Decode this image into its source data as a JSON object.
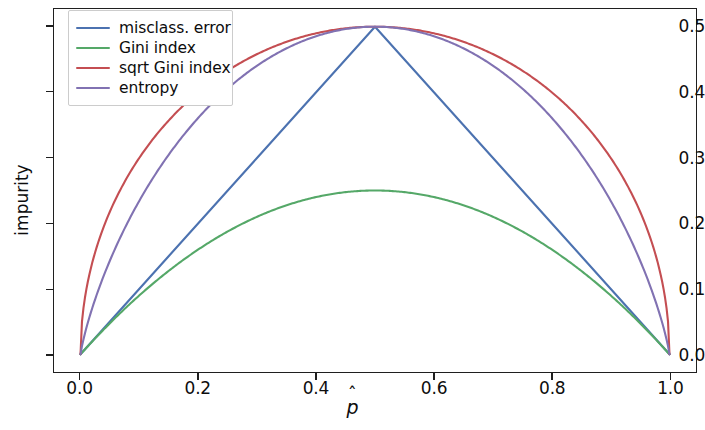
{
  "chart_data": {
    "type": "line",
    "title": "",
    "xlabel": "p̂",
    "xlabel_base": "p",
    "xlabel_accent": "ˆ",
    "ylabel": "impurity",
    "xlim": [
      -0.045,
      1.045
    ],
    "ylim": [
      -0.027,
      0.527
    ],
    "xticks": [
      0.0,
      0.2,
      0.4,
      0.6,
      0.8,
      1.0
    ],
    "xticklabels": [
      "0.0",
      "0.2",
      "0.4",
      "0.6",
      "0.8",
      "1.0"
    ],
    "yticks": [
      0.0,
      0.1,
      0.2,
      0.3,
      0.4,
      0.5
    ],
    "yticklabels": [
      "0.0",
      "0.1",
      "0.2",
      "0.3",
      "0.4",
      "0.5"
    ],
    "grid": false,
    "legend_position": "upper left",
    "background": "#ffffff",
    "axes_color": "#1f1f1f",
    "series": [
      {
        "name": "misclass. error",
        "color": "#4c72b0",
        "formula": "min(p, 1-p)",
        "x": [
          0.0,
          0.05,
          0.1,
          0.15,
          0.2,
          0.25,
          0.3,
          0.35,
          0.4,
          0.45,
          0.5,
          0.55,
          0.6,
          0.65,
          0.7,
          0.75,
          0.8,
          0.85,
          0.9,
          0.95,
          1.0
        ],
        "values": [
          0.0,
          0.05,
          0.1,
          0.15,
          0.2,
          0.25,
          0.3,
          0.35,
          0.4,
          0.45,
          0.5,
          0.45,
          0.4,
          0.35,
          0.3,
          0.25,
          0.2,
          0.15,
          0.1,
          0.05,
          0.0
        ]
      },
      {
        "name": "Gini index",
        "color": "#55a868",
        "formula": "p*(1-p)",
        "x": [
          0.0,
          0.05,
          0.1,
          0.15,
          0.2,
          0.25,
          0.3,
          0.35,
          0.4,
          0.45,
          0.5,
          0.55,
          0.6,
          0.65,
          0.7,
          0.75,
          0.8,
          0.85,
          0.9,
          0.95,
          1.0
        ],
        "values": [
          0.0,
          0.0475,
          0.09,
          0.1275,
          0.16,
          0.1875,
          0.21,
          0.2275,
          0.24,
          0.2475,
          0.25,
          0.2475,
          0.24,
          0.2275,
          0.21,
          0.1875,
          0.16,
          0.1275,
          0.09,
          0.0475,
          0.0
        ]
      },
      {
        "name": "sqrt Gini index",
        "color": "#c44e52",
        "formula": "sqrt(p*(1-p))",
        "x": [
          0.0,
          0.05,
          0.1,
          0.15,
          0.2,
          0.25,
          0.3,
          0.35,
          0.4,
          0.45,
          0.5,
          0.55,
          0.6,
          0.65,
          0.7,
          0.75,
          0.8,
          0.85,
          0.9,
          0.95,
          1.0
        ],
        "values": [
          0.0,
          0.2179,
          0.3,
          0.3571,
          0.4,
          0.433,
          0.4583,
          0.477,
          0.4899,
          0.4975,
          0.5,
          0.4975,
          0.4899,
          0.477,
          0.4583,
          0.433,
          0.4,
          0.3571,
          0.3,
          0.2179,
          0.0
        ]
      },
      {
        "name": "entropy",
        "color": "#8172b2",
        "formula": "-0.5*(p*log2(p) + (1-p)*log2(1-p))",
        "x": [
          0.0,
          0.05,
          0.1,
          0.15,
          0.2,
          0.25,
          0.3,
          0.35,
          0.4,
          0.45,
          0.5,
          0.55,
          0.6,
          0.65,
          0.7,
          0.75,
          0.8,
          0.85,
          0.9,
          0.95,
          1.0
        ],
        "values": [
          0.0,
          0.143,
          0.2345,
          0.3049,
          0.361,
          0.4056,
          0.4406,
          0.4669,
          0.4855,
          0.4963,
          0.5,
          0.4963,
          0.4855,
          0.4669,
          0.4406,
          0.4056,
          0.361,
          0.3049,
          0.2345,
          0.143,
          0.0
        ]
      }
    ]
  },
  "legend": {
    "items": [
      {
        "label": "misclass. error",
        "color": "#4c72b0"
      },
      {
        "label": "Gini index",
        "color": "#55a868"
      },
      {
        "label": "sqrt Gini index",
        "color": "#c44e52"
      },
      {
        "label": "entropy",
        "color": "#8172b2"
      }
    ]
  }
}
